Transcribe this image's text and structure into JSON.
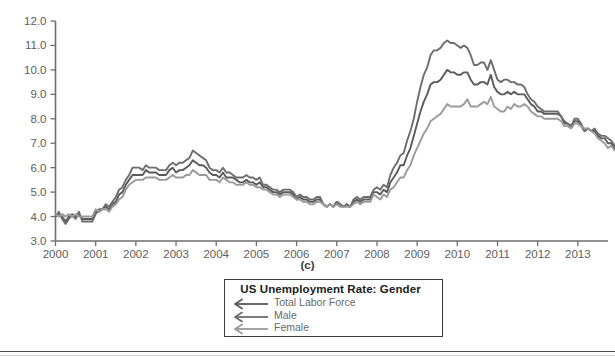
{
  "panel_caption": "(c)",
  "legend": {
    "title": "US Unemployment Rate: Gender",
    "entries": [
      {
        "label": "Total Labor Force",
        "color": "#5a5a5a",
        "marker": "left-arrow-icon"
      },
      {
        "label": "Male",
        "color": "#6d6d6d",
        "marker": "left-arrow-icon"
      },
      {
        "label": "Female",
        "color": "#9a9a9a",
        "marker": "left-arrow-icon"
      }
    ]
  },
  "chart_data": {
    "type": "line",
    "title": "US Unemployment Rate: Gender",
    "xlabel": "",
    "ylabel": "",
    "xlim": [
      2000.0,
      2013.75
    ],
    "ylim": [
      3.0,
      12.0
    ],
    "grid": false,
    "legend_position": "below-plot-center",
    "ytick_labels": [
      "3.0",
      "4.0",
      "5.0",
      "6.0",
      "7.0",
      "8.0",
      "9.0",
      "10.0",
      "11.0",
      "12.0"
    ],
    "ytick_values": [
      3.0,
      4.0,
      5.0,
      6.0,
      7.0,
      8.0,
      9.0,
      10.0,
      11.0,
      12.0
    ],
    "xtick_labels": [
      "2000",
      "2001",
      "2002",
      "2003",
      "2004",
      "2005",
      "2006",
      "2007",
      "2008",
      "2009",
      "2010",
      "2011",
      "2012",
      "2013"
    ],
    "xtick_values": [
      2000,
      2001,
      2002,
      2003,
      2004,
      2005,
      2006,
      2007,
      2008,
      2009,
      2010,
      2011,
      2012,
      2013
    ],
    "x_start": 2000.0,
    "x_step": 0.08333,
    "series": [
      {
        "name": "Total Labor Force",
        "color": "#5a5a5a",
        "values": [
          4.0,
          4.1,
          4.0,
          3.8,
          4.0,
          4.0,
          4.0,
          4.1,
          3.9,
          3.9,
          3.9,
          3.9,
          4.2,
          4.2,
          4.3,
          4.4,
          4.3,
          4.5,
          4.6,
          4.9,
          5.0,
          5.3,
          5.5,
          5.7,
          5.7,
          5.7,
          5.7,
          5.9,
          5.8,
          5.8,
          5.8,
          5.7,
          5.7,
          5.7,
          5.9,
          6.0,
          5.8,
          5.9,
          5.9,
          6.0,
          6.1,
          6.3,
          6.2,
          6.1,
          6.1,
          6.0,
          5.8,
          5.7,
          5.7,
          5.6,
          5.8,
          5.6,
          5.6,
          5.6,
          5.5,
          5.4,
          5.4,
          5.5,
          5.4,
          5.4,
          5.3,
          5.4,
          5.2,
          5.2,
          5.1,
          5.0,
          5.0,
          4.9,
          5.0,
          5.0,
          5.0,
          4.9,
          4.7,
          4.8,
          4.7,
          4.7,
          4.6,
          4.6,
          4.7,
          4.7,
          4.5,
          4.4,
          4.5,
          4.4,
          4.6,
          4.5,
          4.4,
          4.5,
          4.4,
          4.6,
          4.7,
          4.6,
          4.7,
          4.7,
          4.7,
          5.0,
          5.0,
          4.9,
          5.1,
          5.0,
          5.4,
          5.6,
          5.8,
          6.1,
          6.1,
          6.5,
          6.8,
          7.3,
          7.8,
          8.3,
          8.7,
          9.0,
          9.4,
          9.5,
          9.5,
          9.6,
          9.8,
          10.0,
          9.9,
          9.9,
          9.8,
          9.8,
          9.9,
          9.9,
          9.6,
          9.4,
          9.4,
          9.5,
          9.5,
          9.4,
          9.8,
          9.3,
          9.1,
          9.0,
          9.0,
          9.1,
          9.0,
          9.1,
          9.0,
          9.0,
          9.0,
          8.8,
          8.6,
          8.5,
          8.3,
          8.3,
          8.2,
          8.2,
          8.2,
          8.2,
          8.2,
          8.1,
          7.8,
          7.8,
          7.7,
          7.9,
          7.9,
          7.7,
          7.5,
          7.6,
          7.5,
          7.5,
          7.3,
          7.2,
          7.2,
          7.0,
          7.0,
          6.8
        ]
      },
      {
        "name": "Male",
        "color": "#6d6d6d",
        "values": [
          4.0,
          4.2,
          3.9,
          3.7,
          3.9,
          4.1,
          3.9,
          4.2,
          3.8,
          3.8,
          3.8,
          3.8,
          4.1,
          4.3,
          4.3,
          4.5,
          4.4,
          4.6,
          4.8,
          5.1,
          5.2,
          5.5,
          5.7,
          6.0,
          6.0,
          6.0,
          5.9,
          6.1,
          6.0,
          6.0,
          6.0,
          5.9,
          5.9,
          5.9,
          6.1,
          6.2,
          6.1,
          6.2,
          6.2,
          6.3,
          6.4,
          6.7,
          6.6,
          6.5,
          6.4,
          6.3,
          6.0,
          5.9,
          5.9,
          5.8,
          6.0,
          5.8,
          5.8,
          5.7,
          5.6,
          5.6,
          5.6,
          5.7,
          5.6,
          5.6,
          5.5,
          5.6,
          5.3,
          5.3,
          5.2,
          5.1,
          5.1,
          5.0,
          5.1,
          5.1,
          5.1,
          5.0,
          4.8,
          4.9,
          4.8,
          4.8,
          4.7,
          4.7,
          4.8,
          4.8,
          4.5,
          4.4,
          4.5,
          4.4,
          4.6,
          4.5,
          4.4,
          4.5,
          4.4,
          4.7,
          4.8,
          4.7,
          4.8,
          4.8,
          4.8,
          5.1,
          5.2,
          5.1,
          5.3,
          5.2,
          5.7,
          6.0,
          6.2,
          6.5,
          6.6,
          7.1,
          7.5,
          8.0,
          8.7,
          9.3,
          9.8,
          10.1,
          10.6,
          10.8,
          10.8,
          10.9,
          11.1,
          11.2,
          11.1,
          11.1,
          11.0,
          10.9,
          11.0,
          10.9,
          10.6,
          10.2,
          10.2,
          10.3,
          10.3,
          10.0,
          10.4,
          10.0,
          9.6,
          9.5,
          9.6,
          9.6,
          9.5,
          9.5,
          9.4,
          9.4,
          9.3,
          9.0,
          8.8,
          8.7,
          8.5,
          8.4,
          8.3,
          8.3,
          8.3,
          8.3,
          8.3,
          8.1,
          7.9,
          7.8,
          7.7,
          8.0,
          8.0,
          7.8,
          7.5,
          7.6,
          7.5,
          7.6,
          7.4,
          7.3,
          7.3,
          7.2,
          7.1,
          6.9
        ]
      },
      {
        "name": "Female",
        "color": "#9a9a9a",
        "values": [
          4.1,
          4.0,
          4.1,
          4.0,
          4.1,
          4.0,
          4.1,
          4.0,
          4.0,
          4.0,
          4.0,
          4.0,
          4.3,
          4.2,
          4.3,
          4.3,
          4.2,
          4.4,
          4.5,
          4.7,
          4.8,
          5.1,
          5.3,
          5.4,
          5.5,
          5.5,
          5.5,
          5.6,
          5.6,
          5.6,
          5.6,
          5.5,
          5.5,
          5.5,
          5.6,
          5.7,
          5.6,
          5.6,
          5.6,
          5.7,
          5.7,
          5.9,
          5.8,
          5.7,
          5.7,
          5.7,
          5.5,
          5.5,
          5.5,
          5.4,
          5.6,
          5.5,
          5.4,
          5.4,
          5.3,
          5.3,
          5.3,
          5.4,
          5.3,
          5.3,
          5.2,
          5.2,
          5.1,
          5.1,
          5.0,
          4.9,
          4.9,
          4.8,
          4.9,
          4.9,
          4.9,
          4.8,
          4.7,
          4.7,
          4.6,
          4.6,
          4.5,
          4.5,
          4.6,
          4.6,
          4.5,
          4.4,
          4.5,
          4.4,
          4.5,
          4.4,
          4.4,
          4.4,
          4.4,
          4.5,
          4.6,
          4.5,
          4.6,
          4.6,
          4.6,
          4.9,
          4.8,
          4.7,
          4.9,
          4.8,
          5.1,
          5.2,
          5.4,
          5.6,
          5.6,
          5.9,
          6.1,
          6.5,
          6.8,
          7.1,
          7.4,
          7.6,
          7.9,
          8.0,
          8.1,
          8.2,
          8.4,
          8.6,
          8.5,
          8.5,
          8.5,
          8.5,
          8.6,
          8.8,
          8.5,
          8.5,
          8.5,
          8.6,
          8.7,
          8.6,
          8.9,
          8.5,
          8.4,
          8.3,
          8.3,
          8.5,
          8.4,
          8.6,
          8.5,
          8.5,
          8.6,
          8.5,
          8.3,
          8.2,
          8.1,
          8.1,
          8.0,
          8.0,
          8.0,
          8.0,
          8.0,
          7.9,
          7.7,
          7.7,
          7.6,
          7.8,
          7.8,
          7.7,
          7.6,
          7.6,
          7.5,
          7.4,
          7.2,
          7.1,
          7.0,
          6.8,
          6.9,
          6.7
        ]
      }
    ]
  }
}
